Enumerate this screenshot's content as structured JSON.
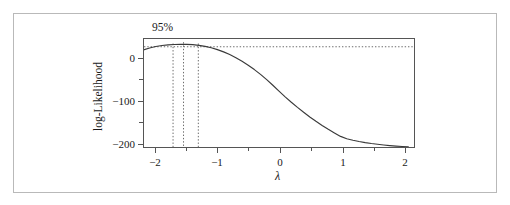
{
  "figure": {
    "kind": "box-cox-log-likelihood-profile",
    "confidence_label": "95%"
  },
  "chart_data": {
    "type": "line",
    "title": "",
    "subtitle": "",
    "xlabel": "λ",
    "ylabel": "log-Likelihood",
    "xlim": [
      -2.2,
      2.2
    ],
    "ylim": [
      -215,
      45
    ],
    "grid": false,
    "legend": null,
    "xticks": [
      -2,
      -1,
      0,
      1,
      2
    ],
    "xticklabels": [
      "−2",
      "−1",
      "0",
      "1",
      "2"
    ],
    "yticks": [
      0,
      -100,
      -200
    ],
    "yticklabels": [
      "0",
      "−100",
      "−200"
    ],
    "yminorticks": [
      -50,
      -150
    ],
    "xminorticks": [
      -1.5,
      -0.5,
      0.5,
      1.5
    ],
    "annotations": [
      {
        "text": "95%",
        "x": -1.85,
        "y": 44,
        "kind": "confidence-level-label"
      }
    ],
    "reference_lines": {
      "horizontal_dotted": {
        "y": 25.4,
        "label": "95% confidence cutoff"
      },
      "vertical_dotted": [
        {
          "x": -1.72,
          "label": "ci-lower"
        },
        {
          "x": -1.55,
          "label": "mle"
        },
        {
          "x": -1.31,
          "label": "ci-upper"
        }
      ]
    },
    "series": [
      {
        "name": "log-Likelihood",
        "x": [
          -2.2,
          -2.1,
          -2.0,
          -1.9,
          -1.8,
          -1.7,
          -1.6,
          -1.5,
          -1.4,
          -1.3,
          -1.2,
          -1.1,
          -1.0,
          -0.9,
          -0.8,
          -0.7,
          -0.6,
          -0.5,
          -0.4,
          -0.3,
          -0.2,
          -0.1,
          0.0,
          0.1,
          0.2,
          0.3,
          0.4,
          0.5,
          0.6,
          0.7,
          0.8,
          0.9,
          1.0,
          1.1,
          1.2,
          1.3,
          1.4,
          1.5,
          1.6,
          1.7,
          1.8,
          1.9,
          2.0,
          2.1
        ],
        "values": [
          18.0,
          22.5,
          26.0,
          28.5,
          30.0,
          30.8,
          31.0,
          31.0,
          30.3,
          28.8,
          26.4,
          23.0,
          18.6,
          13.2,
          6.8,
          -0.6,
          -9.0,
          -18.4,
          -28.8,
          -40.2,
          -52.6,
          -66.0,
          -80.0,
          -93.6,
          -106.4,
          -118.6,
          -130.2,
          -141.2,
          -151.6,
          -161.4,
          -170.6,
          -179.2,
          -187.4,
          -193.0,
          -196.6,
          -199.6,
          -202.2,
          -204.4,
          -206.2,
          -207.8,
          -209.2,
          -210.4,
          -211.4,
          -212.2
        ]
      }
    ]
  },
  "axes": {
    "y": {
      "label": "log-Likelihood",
      "ticks": [
        {
          "value": 0,
          "label": "0"
        },
        {
          "value": -100,
          "label": "−100"
        },
        {
          "value": -200,
          "label": "−200"
        }
      ]
    },
    "x": {
      "label": "λ",
      "ticks": [
        {
          "value": -2,
          "label": "−2"
        },
        {
          "value": -1,
          "label": "−1"
        },
        {
          "value": 0,
          "label": "0"
        },
        {
          "value": 1,
          "label": "1"
        },
        {
          "value": 2,
          "label": "2"
        }
      ]
    }
  },
  "colors": {
    "curve": "#3a3a3a",
    "axis": "#555555",
    "dotted": "#6b6b6b",
    "text": "#1a1a1a",
    "outer_border": "#b9b9b9",
    "background": "#ffffff"
  }
}
